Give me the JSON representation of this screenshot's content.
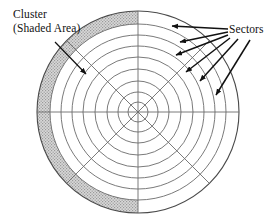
{
  "figure": {
    "background_color": "#ffffff",
    "width": 280,
    "height": 223
  },
  "annotations": {
    "cluster": {
      "line1": "Cluster",
      "line2": "(Shaded Area)",
      "description": "Shaded band on the outermost track covering the left half of the platter",
      "arrow_from": [
        55,
        42
      ],
      "arrow_to": [
        88,
        76
      ],
      "color": "#111111"
    },
    "sectors": {
      "label": "Sectors",
      "description": "Radial wedge divisions of the platter",
      "color": "#111111",
      "arrows": [
        {
          "from": [
            228,
            30
          ],
          "to": [
            168,
            27
          ]
        },
        {
          "from": [
            228,
            32
          ],
          "to": [
            176,
            42
          ]
        },
        {
          "from": [
            228,
            35
          ],
          "to": [
            172,
            56
          ]
        },
        {
          "from": [
            230,
            38
          ],
          "to": [
            182,
            73
          ]
        },
        {
          "from": [
            236,
            38
          ],
          "to": [
            196,
            82
          ]
        },
        {
          "from": [
            246,
            40
          ],
          "to": [
            213,
            96
          ]
        }
      ]
    }
  },
  "disk": {
    "center_x": 138,
    "center_y": 112,
    "outer_radius": 101,
    "track_radii": [
      101,
      88,
      77,
      66,
      55,
      43,
      31,
      20,
      10
    ],
    "track_count": 8,
    "sector_count": 8,
    "sector_line_angles_deg": [
      0,
      45,
      90,
      135,
      180,
      225,
      270,
      315
    ],
    "stroke_color": "#6b6b6b",
    "outline_color": "#4a4a4a",
    "fill_color": "#ffffff",
    "cluster_band": {
      "outer_radius": 101,
      "inner_radius": 88,
      "start_angle_deg": 90,
      "end_angle_deg": 270,
      "fill_color": "#c9c9c9",
      "stipple": true
    }
  }
}
